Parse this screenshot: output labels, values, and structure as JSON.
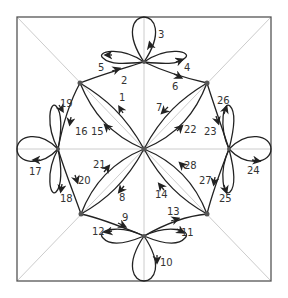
{
  "diagram": {
    "type": "directed multigraph on a square with diagonals",
    "frame": {
      "x": 17,
      "y": 17,
      "width": 254,
      "height": 264
    },
    "colors": {
      "edge": "#222222",
      "node": "#555555",
      "guide": "#cccccc",
      "frame": "#555555"
    },
    "nodes": {
      "center": {
        "x": 144,
        "y": 149
      },
      "tl": {
        "x": 80,
        "y": 83
      },
      "tr": {
        "x": 207,
        "y": 83
      },
      "bl": {
        "x": 81,
        "y": 214
      },
      "br": {
        "x": 207,
        "y": 214
      },
      "top": {
        "x": 144,
        "y": 62
      },
      "left": {
        "x": 58,
        "y": 149
      },
      "right": {
        "x": 229,
        "y": 149
      },
      "bottom": {
        "x": 144,
        "y": 236
      }
    },
    "edge_labels": {
      "e1": "1",
      "e2": "2",
      "e3": "3",
      "e4": "4",
      "e5": "5",
      "e6": "6",
      "e7": "7",
      "e8": "8",
      "e9": "9",
      "e10": "10",
      "e11": "11",
      "e12": "12",
      "e13": "13",
      "e14": "14",
      "e15": "15",
      "e16": "16",
      "e17": "17",
      "e18": "18",
      "e19": "19",
      "e20": "20",
      "e21": "21",
      "e22": "22",
      "e23": "23",
      "e24": "24",
      "e25": "25",
      "e26": "26",
      "e27": "27",
      "e28": "28"
    }
  }
}
